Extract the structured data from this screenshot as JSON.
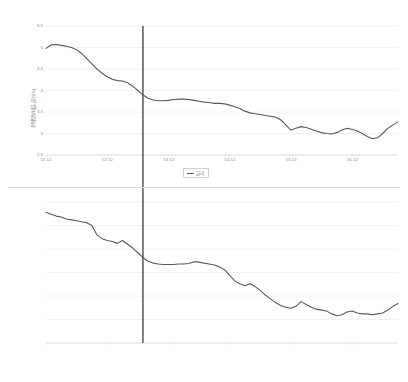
{
  "chart_data": [
    {
      "type": "line",
      "panel": "top",
      "title": "",
      "xlabel": "",
      "ylabel": "주택담보대출금리(%)",
      "ylim": [
        2.5,
        5.5
      ],
      "yticks": [
        "5.5",
        "5",
        "4.5",
        "4",
        "3.5",
        "3",
        "2.5"
      ],
      "ytick_values": [
        5.5,
        5.0,
        4.5,
        4.0,
        3.5,
        3.0,
        2.5
      ],
      "xticks": [
        "'11.12",
        "'12.12",
        "'13.12",
        "'14.12",
        "'15.12",
        "'16.12"
      ],
      "xtick_values": [
        0,
        12,
        24,
        36,
        48,
        60
      ],
      "xlim": [
        0,
        69
      ],
      "grid": true,
      "legend": {
        "position": "bottom-center",
        "entries": [
          "금리"
        ]
      },
      "series": [
        {
          "name": "금리",
          "color": "#595959",
          "x": [
            0,
            1,
            2,
            3,
            4,
            5,
            6,
            7,
            8,
            9,
            10,
            11,
            12,
            13,
            14,
            15,
            16,
            17,
            18,
            19,
            20,
            21,
            22,
            23,
            24,
            25,
            26,
            27,
            28,
            29,
            30,
            31,
            32,
            33,
            34,
            35,
            36,
            37,
            38,
            39,
            40,
            41,
            42,
            43,
            44,
            45,
            46,
            47,
            48,
            49,
            50,
            51,
            52,
            53,
            54,
            55,
            56,
            57,
            58,
            59,
            60,
            61,
            62,
            63,
            64,
            65,
            66,
            67,
            68,
            69
          ],
          "values": [
            4.98,
            5.06,
            5.07,
            5.05,
            5.03,
            5.0,
            4.95,
            4.86,
            4.74,
            4.62,
            4.5,
            4.4,
            4.32,
            4.26,
            4.23,
            4.22,
            4.18,
            4.1,
            4.0,
            3.9,
            3.82,
            3.78,
            3.76,
            3.76,
            3.77,
            3.79,
            3.8,
            3.8,
            3.79,
            3.77,
            3.75,
            3.73,
            3.72,
            3.7,
            3.7,
            3.69,
            3.66,
            3.62,
            3.58,
            3.52,
            3.48,
            3.46,
            3.44,
            3.42,
            3.4,
            3.38,
            3.32,
            3.2,
            3.08,
            3.12,
            3.16,
            3.14,
            3.1,
            3.06,
            3.02,
            3.0,
            2.99,
            3.02,
            3.08,
            3.12,
            3.1,
            3.06,
            3.0,
            2.93,
            2.88,
            2.9,
            3.0,
            3.12,
            3.2,
            3.27
          ]
        }
      ],
      "reference_line": {
        "x": 19,
        "color": "#4a4a4a"
      }
    },
    {
      "type": "line",
      "panel": "bottom",
      "title": "",
      "xlabel": "",
      "ylabel": "예금은행수신금리(%)",
      "ylim": [
        1.0,
        4.0
      ],
      "yticks": [
        "4",
        "3.5",
        "3",
        "2.5",
        "2",
        "1.5",
        "1"
      ],
      "ytick_values": [
        4.0,
        3.5,
        3.0,
        2.5,
        2.0,
        1.5,
        1.0
      ],
      "xticks": [
        "'11.12",
        "'12.12",
        "'13.12",
        "'14.12",
        "'15.12",
        "'16.12"
      ],
      "xtick_values": [
        0,
        12,
        24,
        36,
        48,
        60
      ],
      "xlim": [
        0,
        69
      ],
      "grid": true,
      "legend": {
        "position": "bottom-center",
        "entries": [
          "금리"
        ]
      },
      "series": [
        {
          "name": "금리",
          "color": "#595959",
          "x": [
            0,
            1,
            2,
            3,
            4,
            5,
            6,
            7,
            8,
            9,
            10,
            11,
            12,
            13,
            14,
            15,
            16,
            17,
            18,
            19,
            20,
            21,
            22,
            23,
            24,
            25,
            26,
            27,
            28,
            29,
            30,
            31,
            32,
            33,
            34,
            35,
            36,
            37,
            38,
            39,
            40,
            41,
            42,
            43,
            44,
            45,
            46,
            47,
            48,
            49,
            50,
            51,
            52,
            53,
            54,
            55,
            56,
            57,
            58,
            59,
            60,
            61,
            62,
            63,
            64,
            65,
            66,
            67,
            68,
            69
          ],
          "values": [
            3.78,
            3.74,
            3.7,
            3.68,
            3.64,
            3.62,
            3.6,
            3.58,
            3.56,
            3.5,
            3.3,
            3.22,
            3.18,
            3.16,
            3.12,
            3.18,
            3.1,
            3.02,
            2.92,
            2.82,
            2.74,
            2.7,
            2.68,
            2.67,
            2.67,
            2.67,
            2.68,
            2.68,
            2.69,
            2.73,
            2.72,
            2.7,
            2.68,
            2.66,
            2.62,
            2.56,
            2.44,
            2.32,
            2.26,
            2.22,
            2.26,
            2.2,
            2.12,
            2.02,
            1.94,
            1.86,
            1.8,
            1.76,
            1.74,
            1.78,
            1.88,
            1.82,
            1.76,
            1.72,
            1.7,
            1.68,
            1.62,
            1.58,
            1.6,
            1.66,
            1.68,
            1.64,
            1.62,
            1.62,
            1.6,
            1.62,
            1.64,
            1.7,
            1.78,
            1.84
          ]
        }
      ],
      "reference_line": {
        "x": 19,
        "color": "#4a4a4a"
      }
    }
  ]
}
